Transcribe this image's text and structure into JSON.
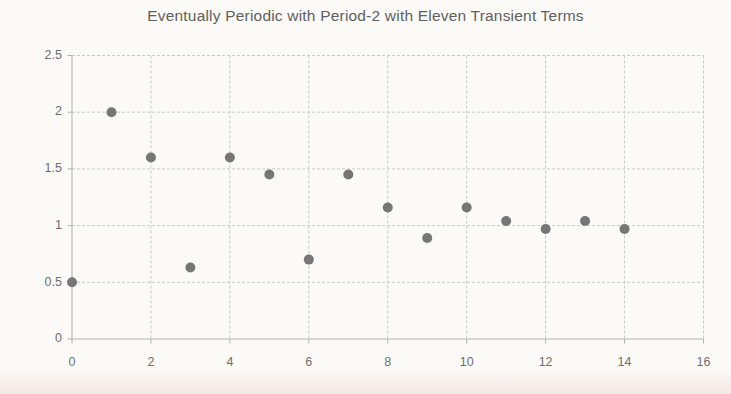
{
  "chart_data": {
    "type": "scatter",
    "title": "Eventually Periodic with Period-2 with Eleven Transient Terms",
    "x": [
      0,
      1,
      2,
      3,
      4,
      5,
      6,
      7,
      8,
      9,
      10,
      11,
      12,
      13,
      14
    ],
    "y": [
      0.5,
      2.0,
      1.6,
      0.63,
      1.6,
      1.45,
      0.7,
      1.45,
      1.16,
      0.89,
      1.16,
      1.04,
      0.97,
      1.04,
      0.97
    ],
    "xlim": [
      0,
      16
    ],
    "ylim": [
      0,
      2.5
    ],
    "x_ticks": [
      0,
      2,
      4,
      6,
      8,
      10,
      12,
      14,
      16
    ],
    "x_tick_labels": [
      "0",
      "2",
      "4",
      "6",
      "8",
      "10",
      "12",
      "14",
      "16"
    ],
    "y_ticks": [
      0,
      0.5,
      1,
      1.5,
      2,
      2.5
    ],
    "y_tick_labels": [
      "0",
      "0.5",
      "1",
      "1.5",
      "2",
      "2.5"
    ],
    "grid": true,
    "legend": "none",
    "colors": {
      "marker": "#767676",
      "gridline": "#cbc9c2",
      "axis": "#b3b1ab",
      "tick_label": "#6e6e6e",
      "title": "#606060",
      "background": "#fbfaf7",
      "bottom_tint": "#e8c7c2"
    }
  }
}
